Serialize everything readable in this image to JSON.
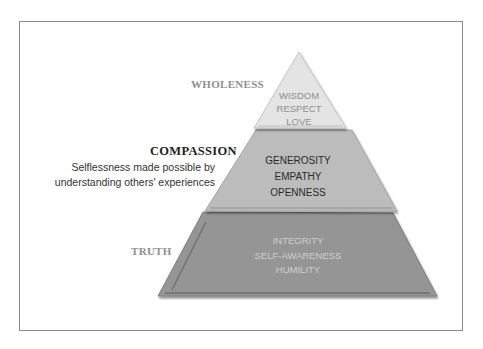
{
  "diagram": {
    "type": "pyramid",
    "tiers": [
      {
        "level": "top",
        "label": "WHOLENESS",
        "items": [
          "WISDOM",
          "RESPECT",
          "LOVE"
        ],
        "fill": "#e4e4e4",
        "text_color": "#8f8f8f"
      },
      {
        "level": "middle",
        "label": "COMPASSION",
        "description_lines": [
          "Selflessness made possible by",
          "understanding others' experiences"
        ],
        "items": [
          "GENEROSITY",
          "EMPATHY",
          "OPENNESS"
        ],
        "fill": "#bcbcbc",
        "text_color": "#2a2a2a"
      },
      {
        "level": "bottom",
        "label": "TRUTH",
        "items": [
          "INTEGRITY",
          "SELF-AWARENESS",
          "HUMILITY"
        ],
        "fill": "#959595",
        "text_color": "#cfcfcf"
      }
    ],
    "frame_color": "#8a8a8a"
  }
}
